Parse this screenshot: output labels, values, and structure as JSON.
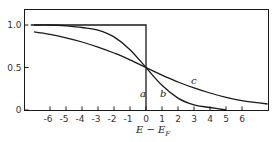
{
  "chart_data": {
    "type": "line",
    "title": "",
    "xlabel": "E − E",
    "xlabel_subscript": "F",
    "ylabel": "",
    "xlim": [
      -7.2,
      7.6
    ],
    "ylim": [
      0,
      1.2
    ],
    "x_ticks": [
      -6,
      -5,
      -4,
      -3,
      -2,
      -1,
      0,
      1,
      2,
      3,
      4,
      5,
      6
    ],
    "x_tick_labels": [
      "-6",
      "-5",
      "-4",
      "-3",
      "-2",
      "-1",
      "0",
      "1",
      "2",
      "3",
      "4",
      "5",
      "6"
    ],
    "y_ticks": [
      0,
      0.5,
      1.0
    ],
    "y_tick_labels": [
      "0",
      "0.5",
      "1.0"
    ],
    "grid": false,
    "legend": "none",
    "series": [
      {
        "name": "a",
        "label": "a",
        "description": "step function (T = 0)",
        "x": [
          -7.2,
          0,
          0
        ],
        "y": [
          1.0,
          1.0,
          0
        ]
      },
      {
        "name": "b",
        "label": "b",
        "description": "Fermi-Dirac, kT ≈ 1.1",
        "x": [
          -7,
          -6,
          -5,
          -4,
          -3,
          -2,
          -1,
          0,
          1,
          2,
          3,
          4,
          5
        ],
        "y": [
          1.0,
          1.0,
          0.99,
          0.97,
          0.94,
          0.86,
          0.71,
          0.5,
          0.29,
          0.14,
          0.06,
          0.03,
          0.0
        ]
      },
      {
        "name": "c",
        "label": "c",
        "description": "Fermi-Dirac, kT ≈ 2.9",
        "x": [
          -7,
          -6,
          -5,
          -4,
          -3,
          -2,
          -1,
          0,
          1,
          2,
          3,
          4,
          5,
          6,
          7.6
        ],
        "y": [
          0.92,
          0.89,
          0.85,
          0.8,
          0.74,
          0.67,
          0.59,
          0.5,
          0.41,
          0.33,
          0.26,
          0.2,
          0.15,
          0.11,
          0.07
        ]
      }
    ]
  }
}
